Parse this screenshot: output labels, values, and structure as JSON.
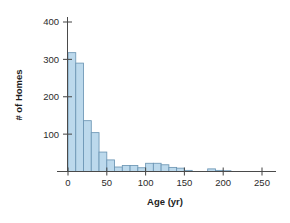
{
  "chart_data": {
    "type": "bar",
    "title": "",
    "subtitle": "",
    "xlabel": "Age (yr)",
    "ylabel": "# of Homes",
    "xlim": [
      0,
      260
    ],
    "ylim": [
      0,
      420
    ],
    "grid": false,
    "legend": null,
    "bin_width": 10,
    "xticks": [
      0,
      50,
      100,
      150,
      200,
      250
    ],
    "xticklabels": [
      "0",
      "50",
      "100",
      "150",
      "200",
      "250"
    ],
    "yticks": [
      100,
      200,
      300,
      400
    ],
    "yticklabels": [
      "100",
      "200",
      "300",
      "400"
    ],
    "bar_color": "#bcd9ec",
    "bar_edge_color": "#6c96b4",
    "axis_color": "#4a4a4a",
    "categories": [
      "0-10",
      "10-20",
      "20-30",
      "30-40",
      "40-50",
      "50-60",
      "60-70",
      "70-80",
      "80-90",
      "90-100",
      "100-110",
      "110-120",
      "120-130",
      "130-140",
      "140-150",
      "150-160",
      "160-170",
      "170-180",
      "180-190",
      "190-200",
      "200-210"
    ],
    "bin_starts": [
      0,
      10,
      20,
      30,
      40,
      50,
      60,
      70,
      80,
      90,
      100,
      110,
      120,
      130,
      140,
      150,
      160,
      170,
      180,
      190,
      200
    ],
    "values": [
      318,
      290,
      136,
      104,
      52,
      31,
      12,
      16,
      16,
      10,
      22,
      22,
      18,
      11,
      9,
      3,
      0,
      0,
      7,
      3,
      2
    ]
  },
  "axes": {
    "x_axis_name": "x-axis",
    "y_axis_name": "y-axis"
  }
}
